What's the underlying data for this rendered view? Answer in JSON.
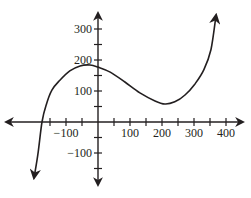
{
  "chart_data": {
    "type": "line",
    "title": "",
    "xlabel": "",
    "ylabel": "",
    "xlim": [
      -200,
      400
    ],
    "ylim": [
      -180,
      350
    ],
    "grid": false,
    "legend": null,
    "x_ticks": [
      -150,
      -100,
      -50,
      50,
      100,
      150,
      200,
      250,
      300,
      350,
      400
    ],
    "x_tick_labels": [
      {
        "value": -100,
        "label": "−100"
      },
      {
        "value": 100,
        "label": "100"
      },
      {
        "value": 200,
        "label": "200"
      },
      {
        "value": 300,
        "label": "300"
      },
      {
        "value": 400,
        "label": "400"
      }
    ],
    "y_ticks": [
      -150,
      -100,
      -50,
      50,
      100,
      150,
      200,
      250,
      300
    ],
    "y_tick_labels": [
      {
        "value": 300,
        "label": "300"
      },
      {
        "value": 200,
        "label": "200"
      },
      {
        "value": 100,
        "label": "100"
      },
      {
        "value": -100,
        "label": "−100"
      }
    ],
    "series": [
      {
        "name": "cubic polynomial",
        "description": "local max about (0, 175), local min about (200, 50), x-intercept about -175, arrows at both ends",
        "x": [
          -200,
          -188,
          -175,
          -162,
          -144,
          -119,
          -88,
          -56,
          -25,
          0,
          38,
          84,
          131,
          178,
          209,
          240,
          272,
          303,
          331,
          353,
          369
        ],
        "y": [
          -181,
          -106,
          0,
          55,
          103,
          135,
          165,
          181,
          184,
          177,
          161,
          129,
          94,
          68,
          58,
          65,
          87,
          123,
          169,
          234,
          345
        ]
      }
    ]
  }
}
